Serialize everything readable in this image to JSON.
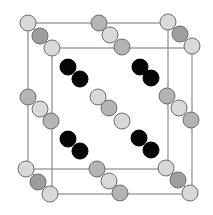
{
  "diagram": {
    "type": "crystal-unit-cell",
    "width": 213,
    "height": 215,
    "atom_radius": 8,
    "colors": {
      "background": "#ffffff",
      "edge": "#8a8a8a",
      "atom_light": "#d9d9d9",
      "atom_mid": "#b4b4b4",
      "atom_dark": "#9e9e9e",
      "atom_black": "#050505",
      "atom_stroke": "#6e6e6e"
    },
    "boxes": [
      {
        "name": "back-face",
        "x": 28,
        "y": 23,
        "w": 140,
        "h": 146
      },
      {
        "name": "front-face",
        "x": 52,
        "y": 48,
        "w": 140,
        "h": 146
      }
    ],
    "connectors": [
      {
        "x1": 28,
        "y1": 23,
        "x2": 52,
        "y2": 48
      },
      {
        "x1": 168,
        "y1": 23,
        "x2": 192,
        "y2": 48
      },
      {
        "x1": 28,
        "y1": 169,
        "x2": 52,
        "y2": 194
      },
      {
        "x1": 168,
        "y1": 169,
        "x2": 192,
        "y2": 194
      }
    ],
    "atom_groups": [
      {
        "name": "corner-top-left",
        "atoms": [
          {
            "cx": 28,
            "cy": 23,
            "fill": "light"
          },
          {
            "cx": 40,
            "cy": 36,
            "fill": "dark"
          },
          {
            "cx": 52,
            "cy": 48,
            "fill": "light"
          }
        ]
      },
      {
        "name": "corner-top-right",
        "atoms": [
          {
            "cx": 168,
            "cy": 22,
            "fill": "light"
          },
          {
            "cx": 180,
            "cy": 34,
            "fill": "dark"
          },
          {
            "cx": 192,
            "cy": 46,
            "fill": "light"
          }
        ]
      },
      {
        "name": "corner-bottom-left",
        "atoms": [
          {
            "cx": 26,
            "cy": 169,
            "fill": "light"
          },
          {
            "cx": 38,
            "cy": 182,
            "fill": "dark"
          },
          {
            "cx": 50,
            "cy": 194,
            "fill": "light"
          }
        ]
      },
      {
        "name": "corner-bottom-right",
        "atoms": [
          {
            "cx": 166,
            "cy": 168,
            "fill": "light"
          },
          {
            "cx": 178,
            "cy": 180,
            "fill": "dark"
          },
          {
            "cx": 190,
            "cy": 193,
            "fill": "light"
          }
        ]
      },
      {
        "name": "edge-top",
        "atoms": [
          {
            "cx": 99,
            "cy": 23,
            "fill": "mid"
          },
          {
            "cx": 110,
            "cy": 35,
            "fill": "light"
          },
          {
            "cx": 122,
            "cy": 47,
            "fill": "mid"
          }
        ]
      },
      {
        "name": "edge-bottom",
        "atoms": [
          {
            "cx": 97,
            "cy": 169,
            "fill": "mid"
          },
          {
            "cx": 109,
            "cy": 181,
            "fill": "light"
          },
          {
            "cx": 120,
            "cy": 193,
            "fill": "mid"
          }
        ]
      },
      {
        "name": "edge-left",
        "atoms": [
          {
            "cx": 28,
            "cy": 97,
            "fill": "mid"
          },
          {
            "cx": 40,
            "cy": 109,
            "fill": "light"
          },
          {
            "cx": 51,
            "cy": 121,
            "fill": "mid"
          }
        ]
      },
      {
        "name": "edge-right",
        "atoms": [
          {
            "cx": 167,
            "cy": 96,
            "fill": "mid"
          },
          {
            "cx": 179,
            "cy": 108,
            "fill": "light"
          },
          {
            "cx": 191,
            "cy": 120,
            "fill": "mid"
          }
        ]
      },
      {
        "name": "center",
        "atoms": [
          {
            "cx": 98,
            "cy": 97,
            "fill": "light"
          },
          {
            "cx": 109,
            "cy": 108,
            "fill": "mid"
          },
          {
            "cx": 122,
            "cy": 121,
            "fill": "light"
          }
        ]
      },
      {
        "name": "interior-top-left",
        "atoms": [
          {
            "cx": 68,
            "cy": 67,
            "fill": "black"
          },
          {
            "cx": 80,
            "cy": 79,
            "fill": "black"
          }
        ]
      },
      {
        "name": "interior-top-right",
        "atoms": [
          {
            "cx": 140,
            "cy": 67,
            "fill": "black"
          },
          {
            "cx": 151,
            "cy": 78,
            "fill": "black"
          }
        ]
      },
      {
        "name": "interior-bottom-left",
        "atoms": [
          {
            "cx": 68,
            "cy": 139,
            "fill": "black"
          },
          {
            "cx": 80,
            "cy": 151,
            "fill": "black"
          }
        ]
      },
      {
        "name": "interior-bottom-right",
        "atoms": [
          {
            "cx": 139,
            "cy": 138,
            "fill": "black"
          },
          {
            "cx": 151,
            "cy": 150,
            "fill": "black"
          }
        ]
      }
    ]
  }
}
